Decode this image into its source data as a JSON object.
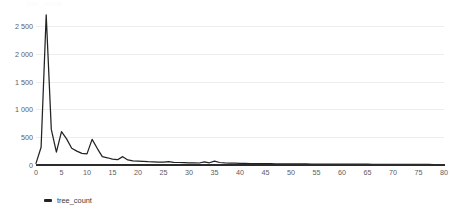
{
  "faint_title": "tree_count",
  "legend": {
    "position": "bottom-left",
    "entries": [
      {
        "label": "tree_count",
        "color": "#232323",
        "marker": "line-marker"
      }
    ]
  },
  "axis": {
    "y_ticks": [
      "0",
      "500",
      "1 000",
      "1 500",
      "2 000",
      "2 500"
    ],
    "x_ticks": [
      "0",
      "5",
      "10",
      "15",
      "20",
      "25",
      "30",
      "35",
      "40",
      "45",
      "50",
      "55",
      "60",
      "65",
      "70",
      "75",
      "80"
    ]
  },
  "colors": {
    "series": "#232323",
    "gridline": "#ededed",
    "baseline": "#2b2b2b",
    "tick_text": "#5c5c5c"
  },
  "chart_data": {
    "type": "line",
    "title": "",
    "subtitle": "",
    "xlabel": "",
    "ylabel": "",
    "xlim": [
      0,
      80
    ],
    "ylim": [
      0,
      2750
    ],
    "grid": "horizontal",
    "legend_position": "bottom-left",
    "y_tick_values": [
      0,
      500,
      1000,
      1500,
      2000,
      2500
    ],
    "x_tick_values": [
      0,
      5,
      10,
      15,
      20,
      25,
      30,
      35,
      40,
      45,
      50,
      55,
      60,
      65,
      70,
      75,
      80
    ],
    "thousands_separator": " ",
    "series": [
      {
        "name": "tree_count",
        "color": "#232323",
        "x": [
          0,
          1,
          2,
          3,
          4,
          5,
          6,
          7,
          8,
          9,
          10,
          11,
          12,
          13,
          14,
          15,
          16,
          17,
          18,
          19,
          20,
          21,
          22,
          23,
          24,
          25,
          26,
          27,
          28,
          29,
          30,
          31,
          32,
          33,
          34,
          35,
          36,
          37,
          38,
          39,
          40,
          41,
          42,
          43,
          44,
          45,
          46,
          47,
          48,
          49,
          50,
          51,
          52,
          53,
          54,
          55,
          56,
          57,
          58,
          59,
          60,
          61,
          62,
          63,
          64,
          65,
          66,
          67,
          68,
          69,
          70,
          71,
          72,
          73,
          74,
          75,
          76,
          77,
          78,
          79,
          80
        ],
        "values": [
          30,
          320,
          2700,
          640,
          230,
          600,
          470,
          300,
          250,
          210,
          200,
          460,
          300,
          150,
          130,
          105,
          95,
          150,
          90,
          75,
          70,
          65,
          60,
          58,
          52,
          50,
          60,
          48,
          45,
          42,
          40,
          38,
          36,
          55,
          40,
          70,
          45,
          38,
          34,
          32,
          30,
          28,
          27,
          26,
          25,
          24,
          23,
          22,
          21,
          21,
          20,
          20,
          19,
          19,
          18,
          18,
          17,
          17,
          16,
          16,
          15,
          15,
          15,
          14,
          14,
          14,
          13,
          13,
          13,
          12,
          12,
          12,
          11,
          11,
          11,
          10,
          10,
          10,
          9,
          9,
          9
        ]
      }
    ]
  }
}
